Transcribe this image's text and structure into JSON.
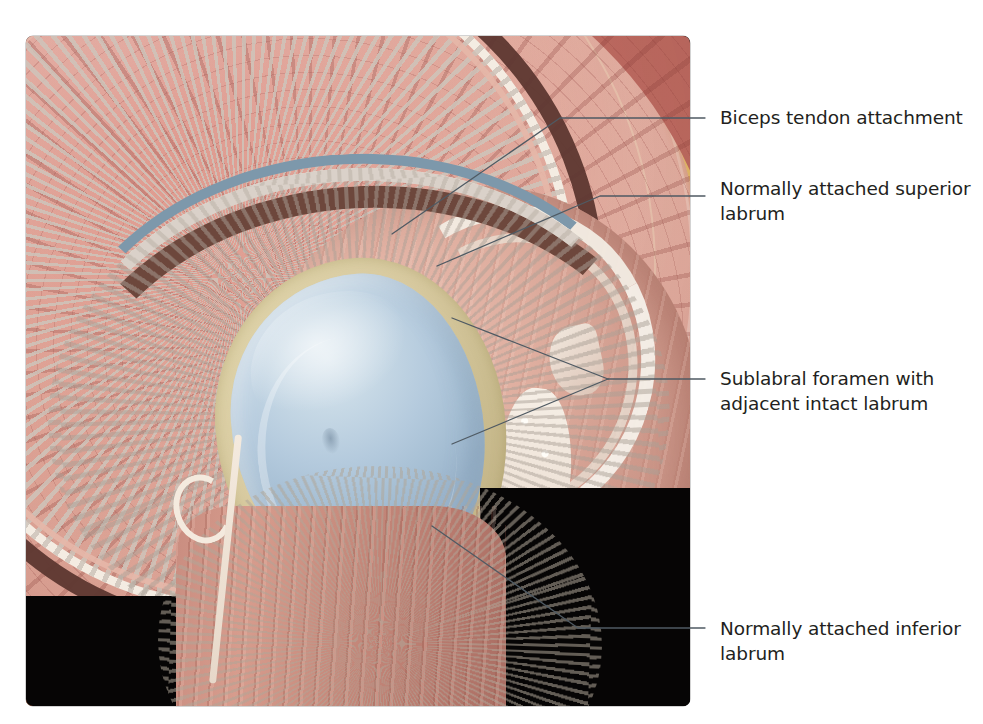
{
  "figure": {
    "domain": "anatomical-illustration",
    "frame": {
      "x": 26,
      "y": 36,
      "width": 664,
      "height": 670,
      "background_color": "#050404"
    }
  },
  "labels": [
    {
      "id": "biceps-tendon-attachment",
      "text": "Biceps tendon attachment",
      "lines": [
        "Biceps tendon attachment"
      ],
      "x": 720,
      "y": 105,
      "leader": {
        "type": "elbow",
        "points": [
          [
            392,
            234
          ],
          [
            560,
            118
          ],
          [
            705,
            118
          ]
        ]
      }
    },
    {
      "id": "normally-attached-superior-labrum",
      "text": "Normally attached superior labrum",
      "lines": [
        "Normally attached superior",
        "labrum"
      ],
      "x": 720,
      "y": 176,
      "leader": {
        "type": "elbow",
        "points": [
          [
            437,
            266
          ],
          [
            600,
            196
          ],
          [
            705,
            196
          ]
        ]
      }
    },
    {
      "id": "sublabral-foramen-with-adjacent-intact-labrum",
      "text": "Sublabral foramen with adjacent intact labrum",
      "lines": [
        "Sublabral foramen with",
        "adjacent intact labrum"
      ],
      "x": 720,
      "y": 366,
      "leader": {
        "type": "converging",
        "branches": [
          [
            [
              452,
              318
            ],
            [
              608,
              379
            ]
          ],
          [
            [
              452,
              444
            ],
            [
              608,
              379
            ]
          ]
        ],
        "stem": [
          [
            608,
            379
          ],
          [
            705,
            379
          ]
        ]
      }
    },
    {
      "id": "normally-attached-inferior-labrum",
      "text": "Normally attached inferior labrum",
      "lines": [
        "Normally attached inferior",
        "labrum"
      ],
      "x": 720,
      "y": 616,
      "leader": {
        "type": "elbow",
        "points": [
          [
            432,
            526
          ],
          [
            578,
            628
          ],
          [
            705,
            628
          ]
        ]
      }
    }
  ],
  "anatomy": {
    "structures": [
      {
        "name": "skin-and-subcutaneous-tissue",
        "color": "#eec3b4"
      },
      {
        "name": "subcutaneous-fat",
        "color": "#edd06a"
      },
      {
        "name": "deltoid-muscle",
        "color": "#bc6a60"
      },
      {
        "name": "joint-capsule",
        "color": "#f4ece2"
      },
      {
        "name": "joint-space",
        "color": "#5d3730"
      },
      {
        "name": "glenoid-labrum",
        "color": "#d8caa0"
      },
      {
        "name": "glenoid-articular-cartilage",
        "color": "#b4cadd"
      },
      {
        "name": "humeral-head",
        "color": "#dfae9f"
      },
      {
        "name": "cancellous-bone",
        "color": "#f6efe6"
      },
      {
        "name": "acromion-cartilage-band",
        "color": "#7d98ab"
      },
      {
        "name": "vascular-structure",
        "color": "#f4eade"
      }
    ]
  },
  "style": {
    "leader_line_color": "#4f5a63",
    "leader_line_width": 1.3,
    "text_color": "#231f20",
    "page_background": "#ffffff"
  }
}
